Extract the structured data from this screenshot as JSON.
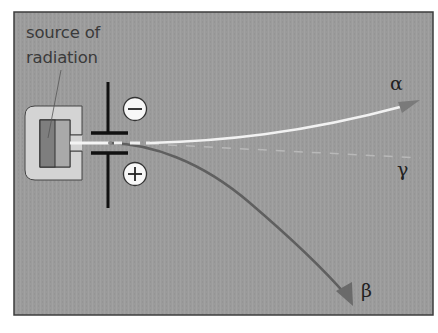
{
  "diagram": {
    "source_label": [
      "source of",
      "radiation"
    ],
    "plates": {
      "negative_symbol": "−",
      "positive_symbol": "+"
    },
    "rays": [
      {
        "name": "alpha",
        "symbol": "α",
        "deflection": "toward negative plate (slight)",
        "style": "white solid"
      },
      {
        "name": "gamma",
        "symbol": "γ",
        "deflection": "none",
        "style": "faint dashed"
      },
      {
        "name": "beta",
        "symbol": "β",
        "deflection": "toward positive plate (strong)",
        "style": "dark gray solid"
      }
    ],
    "colors": {
      "background": "#9b9b9b",
      "frame": "#3c3c3c",
      "housing": "#d4d4d4",
      "source_block": "#7e7e7e",
      "alpha_beam": "#f2f2f2",
      "beta_beam": "#5f5f5f",
      "gamma_beam": "#c0c0c0",
      "plates": "#111111"
    }
  }
}
